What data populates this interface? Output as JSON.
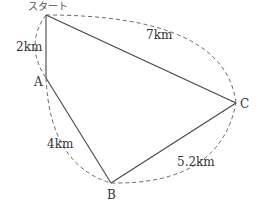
{
  "diagram": {
    "points": {
      "start": {
        "label": "スタート",
        "x": 46,
        "y": 15
      },
      "A": {
        "label": "A",
        "x": 46,
        "y": 78
      },
      "B": {
        "label": "B",
        "x": 111,
        "y": 183
      },
      "C": {
        "label": "C",
        "x": 236,
        "y": 103
      }
    },
    "edges": [
      {
        "from": "start",
        "to": "A",
        "distance": "2km"
      },
      {
        "from": "A",
        "to": "B",
        "distance": "4km"
      },
      {
        "from": "B",
        "to": "C",
        "distance": "5.2km"
      },
      {
        "from": "start",
        "to": "C",
        "distance": "7km"
      }
    ],
    "colors": {
      "line": "#444444",
      "dashed": "#666666",
      "text": "#333333"
    }
  }
}
